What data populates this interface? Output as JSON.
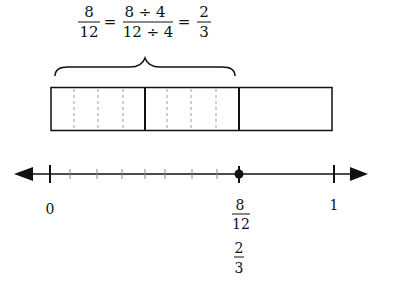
{
  "equation": {
    "lhs": {
      "num": "8",
      "den": "12"
    },
    "eq1": "=",
    "middle": {
      "num": "8 ÷ 4",
      "den": "12 ÷ 4"
    },
    "eq2": "=",
    "rhs": {
      "num": "2",
      "den": "3"
    }
  },
  "bar_model": {
    "parts": 3,
    "subparts_per_part": 4,
    "shaded_parts": 2,
    "brace_covers": "2 of 3 parts"
  },
  "number_line": {
    "start_label": "0",
    "end_label": "1",
    "tick_count_between": 12,
    "point": {
      "num": "8",
      "den": "12"
    },
    "point_equivalent": {
      "num": "2",
      "den": "3"
    }
  },
  "colors": {
    "stroke": "#111111",
    "dashed": "#9a9a9a"
  }
}
